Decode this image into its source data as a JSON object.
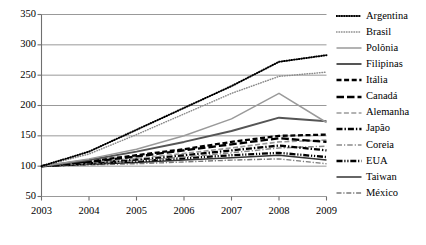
{
  "chart_data": {
    "type": "line",
    "title": "",
    "subtitle": "",
    "xlabel": "",
    "ylabel": "",
    "x": [
      2003,
      2004,
      2005,
      2006,
      2007,
      2008,
      2009
    ],
    "xtick_labels": [
      "2003",
      "2004",
      "2005",
      "2006",
      "2007",
      "2008",
      "2009"
    ],
    "ytick_labels": [
      "50",
      "100",
      "150",
      "200",
      "250",
      "300",
      "350"
    ],
    "ytick_values": [
      50,
      100,
      150,
      200,
      250,
      300,
      350
    ],
    "ylim": [
      50,
      350
    ],
    "xlim": [
      2003,
      2009
    ],
    "grid": "horizontal",
    "legend_position": "right",
    "series": [
      {
        "name": "Argentina",
        "style": "dotted",
        "color": "#000000",
        "values": [
          100,
          124,
          160,
          196,
          232,
          272,
          283
        ]
      },
      {
        "name": "Brasil",
        "style": "fine-dotted",
        "color": "#8a8a8a",
        "values": [
          100,
          120,
          152,
          186,
          220,
          248,
          255
        ]
      },
      {
        "name": "Polônia",
        "style": "solid-light",
        "color": "#9a9a9a",
        "values": [
          100,
          112,
          128,
          150,
          178,
          220,
          172
        ]
      },
      {
        "name": "Filipinas",
        "style": "solid-medium",
        "color": "#555555",
        "values": [
          100,
          110,
          124,
          140,
          158,
          180,
          174
        ]
      },
      {
        "name": "Itália",
        "style": "dashed-bold",
        "color": "#000000",
        "values": [
          100,
          108,
          118,
          128,
          140,
          150,
          152
        ]
      },
      {
        "name": "Canadá",
        "style": "dashed-long",
        "color": "#000000",
        "values": [
          100,
          107,
          116,
          126,
          136,
          146,
          140
        ]
      },
      {
        "name": "Alemanha",
        "style": "dash-gray",
        "color": "#9a9a9a",
        "values": [
          100,
          106,
          113,
          121,
          130,
          140,
          143
        ]
      },
      {
        "name": "Japão",
        "style": "dash-dot-bold",
        "color": "#000000",
        "values": [
          100,
          105,
          111,
          118,
          126,
          134,
          126
        ]
      },
      {
        "name": "Coreia",
        "style": "dash-dot-gray",
        "color": "#8a8a8a",
        "values": [
          100,
          104,
          109,
          115,
          122,
          130,
          133
        ]
      },
      {
        "name": "EUA",
        "style": "dash-dot-dot",
        "color": "#000000",
        "values": [
          100,
          104,
          108,
          113,
          118,
          122,
          115
        ]
      },
      {
        "name": "Taiwan",
        "style": "solid-thin",
        "color": "#333333",
        "values": [
          100,
          103,
          106,
          110,
          114,
          118,
          110
        ]
      },
      {
        "name": "México",
        "style": "dash-dot-light",
        "color": "#7a7a7a",
        "values": [
          100,
          102,
          104,
          107,
          110,
          112,
          104
        ]
      }
    ]
  },
  "caption": {
    "text": ""
  }
}
